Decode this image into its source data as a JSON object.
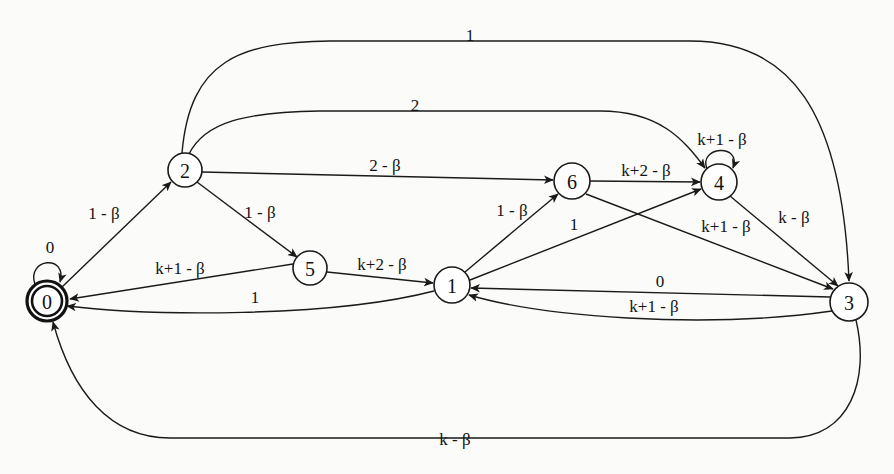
{
  "diagram": {
    "type": "state-machine",
    "background_color": "#fbfbf9",
    "stroke_color": "#1a1a1a",
    "states": [
      {
        "id": "0",
        "label": "0",
        "cx": 47,
        "cy": 301,
        "r": 20,
        "accepting": true
      },
      {
        "id": "2",
        "label": "2",
        "cx": 185,
        "cy": 170,
        "r": 17,
        "accepting": false
      },
      {
        "id": "5",
        "label": "5",
        "cx": 310,
        "cy": 268,
        "r": 17,
        "accepting": false
      },
      {
        "id": "1",
        "label": "1",
        "cx": 452,
        "cy": 285,
        "r": 18,
        "accepting": false
      },
      {
        "id": "6",
        "label": "6",
        "cx": 572,
        "cy": 181,
        "r": 18,
        "accepting": false
      },
      {
        "id": "4",
        "label": "4",
        "cx": 719,
        "cy": 182,
        "r": 18,
        "accepting": false
      },
      {
        "id": "3",
        "label": "3",
        "cx": 849,
        "cy": 302,
        "r": 19,
        "accepting": false
      }
    ],
    "transitions": [
      {
        "from": "0",
        "to": "0",
        "label": "0",
        "label_x": 50,
        "label_y": 247
      },
      {
        "from": "0",
        "to": "2",
        "label": "1 - β",
        "label_x": 104,
        "label_y": 213
      },
      {
        "from": "2",
        "to": "5",
        "label": "1 - β",
        "label_x": 260,
        "label_y": 212
      },
      {
        "from": "2",
        "to": "6",
        "label": "2 - β",
        "label_x": 385,
        "label_y": 165
      },
      {
        "from": "2",
        "to": "3",
        "label": "1",
        "label_x": 470,
        "label_y": 35
      },
      {
        "from": "2",
        "to": "4",
        "label": "2",
        "label_x": 415,
        "label_y": 105
      },
      {
        "from": "5",
        "to": "0",
        "label": "k+1 - β",
        "label_x": 180,
        "label_y": 268
      },
      {
        "from": "5",
        "to": "1",
        "label": "k+2 - β",
        "label_x": 382,
        "label_y": 264
      },
      {
        "from": "1",
        "to": "0",
        "label": "1",
        "label_x": 255,
        "label_y": 297
      },
      {
        "from": "1",
        "to": "6",
        "label": "1 - β",
        "label_x": 512,
        "label_y": 210
      },
      {
        "from": "1",
        "to": "4",
        "label": "1",
        "label_x": 574,
        "label_y": 224
      },
      {
        "from": "6",
        "to": "4",
        "label": "k+2 - β",
        "label_x": 646,
        "label_y": 170
      },
      {
        "from": "6",
        "to": "3",
        "label": "k+1 - β",
        "label_x": 726,
        "label_y": 226
      },
      {
        "from": "4",
        "to": "4",
        "label": "k+1 - β",
        "label_x": 722,
        "label_y": 139
      },
      {
        "from": "4",
        "to": "3",
        "label": "k - β",
        "label_x": 794,
        "label_y": 217
      },
      {
        "from": "3",
        "to": "1",
        "label": "0",
        "label_x": 660,
        "label_y": 281
      },
      {
        "from": "3",
        "to": "1",
        "label": "k+1 - β",
        "label_x": 654,
        "label_y": 306
      },
      {
        "from": "3",
        "to": "0",
        "label": "k - β",
        "label_x": 455,
        "label_y": 439
      }
    ]
  }
}
